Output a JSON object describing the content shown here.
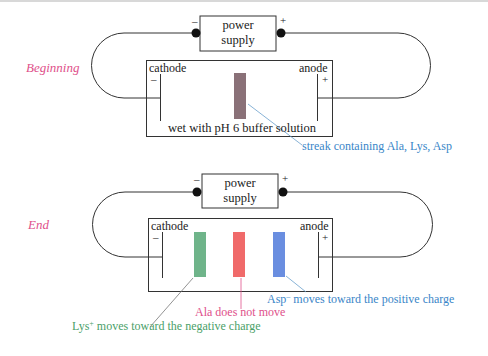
{
  "colors": {
    "stage_label": "#e0508a",
    "streak_mixed": "#8a7178",
    "lys_band": "#6fb48a",
    "ala_band": "#f06a6a",
    "asp_band": "#6a8ee0",
    "caption_blue": "#3a86c8",
    "caption_pink": "#e0508a",
    "caption_green": "#4aa068"
  },
  "beginning": {
    "stage_label": "Beginning",
    "power_supply": {
      "line1": "power",
      "line2": "supply",
      "neg_sign": "–",
      "pos_sign": "+"
    },
    "cathode": {
      "label": "cathode",
      "sign": "–"
    },
    "anode": {
      "label": "anode",
      "sign": "+"
    },
    "buffer_text": "wet with pH 6 buffer solution",
    "streak_caption": "streak containing Ala, Lys, Asp"
  },
  "end": {
    "stage_label": "End",
    "power_supply": {
      "line1": "power",
      "line2": "supply",
      "neg_sign": "–",
      "pos_sign": "+"
    },
    "cathode": {
      "label": "cathode",
      "sign": "–"
    },
    "anode": {
      "label": "anode",
      "sign": "+"
    },
    "asp_caption": {
      "name": "Asp",
      "charge": "–",
      "text": " moves toward the positive charge"
    },
    "ala_caption": "Ala does not move",
    "lys_caption": {
      "name": "Lys",
      "charge": "+",
      "text": " moves toward the negative charge"
    }
  }
}
